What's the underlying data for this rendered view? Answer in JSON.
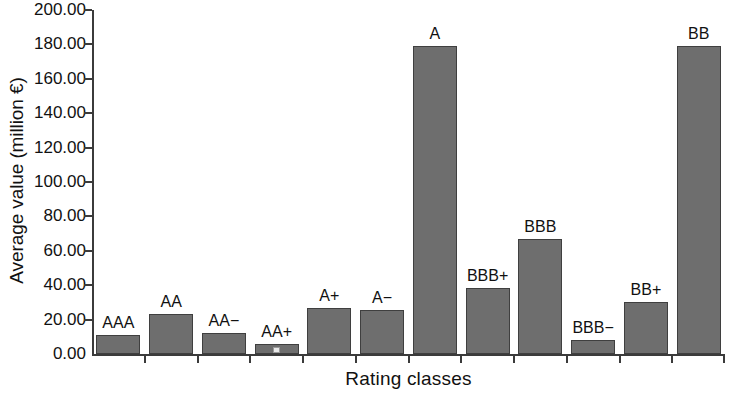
{
  "chart_data": {
    "type": "bar",
    "title": "",
    "xlabel": "Rating classes",
    "ylabel": "Average value (million €)",
    "categories": [
      "AAA",
      "AA",
      "AA−",
      "AA+",
      "A+",
      "A−",
      "A",
      "BBB+",
      "BBB",
      "BBB−",
      "BB+",
      "BB"
    ],
    "values": [
      11.0,
      23.5,
      12.5,
      6.0,
      27.0,
      25.5,
      179.0,
      38.5,
      67.0,
      8.0,
      30.5,
      179.0
    ],
    "ylim": [
      0.0,
      200.0
    ],
    "ytick_labels": [
      "0.00",
      "20.00",
      "40.00",
      "60.00",
      "80.00",
      "100.00",
      "120.00",
      "140.00",
      "160.00",
      "180.00",
      "200.00"
    ],
    "ytick_values": [
      0,
      20,
      40,
      60,
      80,
      100,
      120,
      140,
      160,
      180,
      200
    ],
    "grid": false,
    "legend": "none",
    "bar_color": "#6e6e6e",
    "bar_edge_color": "#3f3f3f",
    "axis_color": "#3b3b3b",
    "background_color": "#ffffff",
    "bar_labels_position": "above-bar"
  }
}
